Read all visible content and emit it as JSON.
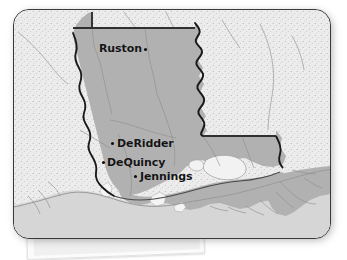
{
  "map": {
    "title": "Louisiana reference map",
    "subject_state": "Louisiana",
    "style": "grayscale stippled reference map on rounded card",
    "colors": {
      "subject_state_fill": "#b1b1b1",
      "neighbor_state_fill": "#ececec",
      "water_fill": "#d6d6d6",
      "lake_fill": "#f2f2f2",
      "border_stroke": "#2f2f2f",
      "river_stroke": "#1a1a1a",
      "county_stroke": "#8d8d8d",
      "card_border": "#3a3a3a",
      "label_text": "#141414",
      "page_background": "#ffffff"
    },
    "cities": [
      {
        "name": "Ruston",
        "label_x": 98,
        "label_y": 44,
        "dot_x": 143,
        "dot_y": 49,
        "label_side": "left"
      },
      {
        "name": "DeRidder",
        "label_x": 116,
        "label_y": 139,
        "dot_x": 110,
        "dot_y": 143,
        "label_side": "right"
      },
      {
        "name": "DeQuincy",
        "label_x": 106,
        "label_y": 158,
        "dot_x": 101,
        "dot_y": 162,
        "label_side": "right"
      },
      {
        "name": "Jennings",
        "label_x": 139,
        "label_y": 172,
        "dot_x": 133,
        "dot_y": 176,
        "label_side": "right"
      }
    ],
    "features": {
      "lake": "Lake Pontchartrain",
      "east_border_river": "Mississippi River",
      "west_border_river": "Sabine River",
      "south_water": "Gulf of Mexico",
      "north_border": "Arkansas state line",
      "east_state": "Mississippi",
      "west_state": "Texas"
    },
    "paper_card": {
      "visible": true,
      "position": "bottom-left beneath map",
      "text": ""
    }
  }
}
